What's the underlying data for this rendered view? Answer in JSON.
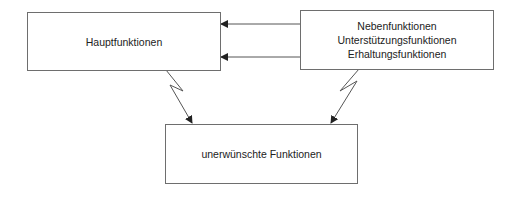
{
  "diagram": {
    "boxes": {
      "main": {
        "label": "Hauptfunktionen"
      },
      "secondary": {
        "lines": [
          "Nebenfunktionen",
          "Unterstützungsfunktionen",
          "Erhaltungsfunktionen"
        ]
      },
      "unwanted": {
        "label": "unerwünschte Funktionen"
      }
    },
    "edges": [
      {
        "from": "secondary",
        "to": "main",
        "style": "arrow"
      },
      {
        "from": "secondary",
        "to": "main",
        "style": "arrow"
      },
      {
        "from": "main",
        "to": "unwanted",
        "style": "lightning-arrow"
      },
      {
        "from": "secondary",
        "to": "unwanted",
        "style": "lightning-arrow"
      }
    ],
    "colors": {
      "line": "#555555",
      "border": "#6e6e6e",
      "text": "#222222"
    }
  }
}
